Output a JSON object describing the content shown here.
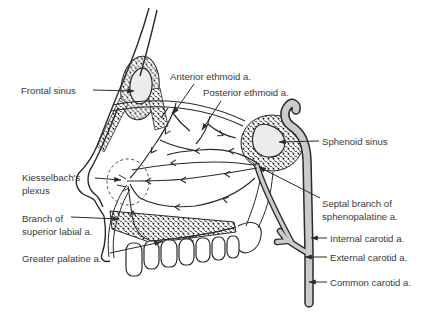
{
  "labels": {
    "frontal_sinus": "Frontal sinus",
    "anterior_ethmoid": "Anterior ethmoid a.",
    "posterior_ethmoid": "Posterior ethmoid a.",
    "sphenoid_sinus": "Sphenoid sinus",
    "kiesselbachs_line1": "Kiesselbach's",
    "kiesselbachs_line2": "plexus",
    "superior_labial_line1": "Branch of",
    "superior_labial_line2": "superior labial a.",
    "greater_palatine": "Greater palatine a.",
    "septal_branch_line1": "Septal branch of",
    "septal_branch_line2": "sphenopalatine a.",
    "internal_carotid": "Internal carotid a.",
    "external_carotid": "External carotid a.",
    "common_carotid": "Common carotid a."
  },
  "colors": {
    "background": "#ffffff",
    "ink": "#2a2a2a",
    "label_text": "#3a3a3a",
    "vessel_gray": "#cbcbcb",
    "sinus_fill": "#ececec"
  }
}
